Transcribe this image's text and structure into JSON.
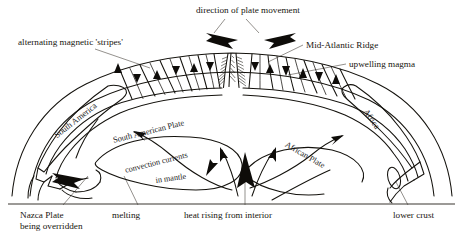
{
  "diagram": {
    "style": {
      "ink": "#14120d",
      "fill": "#ffffff",
      "text": "#17150f"
    },
    "callouts": [
      {
        "id": "direction-of-plate-movement",
        "text": "direction of plate movement",
        "x": 196,
        "y": 6
      },
      {
        "id": "alternating-magnetic-stripes",
        "text": "alternating magnetic 'stripes'",
        "x": 18,
        "y": 38
      },
      {
        "id": "mid-atlantic-ridge",
        "text": "Mid-Atlantic Ridge",
        "x": 306,
        "y": 41
      },
      {
        "id": "upwelling-magma",
        "text": "upwelling magma",
        "x": 349,
        "y": 60
      },
      {
        "id": "melting",
        "text": "melting",
        "x": 112,
        "y": 211
      },
      {
        "id": "heat-rising-from-interior",
        "text": "heat rising from interior",
        "x": 184,
        "y": 211
      },
      {
        "id": "lower-crust",
        "text": "lower crust",
        "x": 393,
        "y": 211
      }
    ],
    "callouts_multiline": [
      {
        "id": "nazca-plate-being-overridden",
        "line1": "Nazca Plate",
        "line2": "being overridden",
        "x": 20,
        "y": 211
      }
    ],
    "map_labels": [
      {
        "id": "south-america",
        "text": "South America",
        "x": 52,
        "y": 132,
        "rotate": -38,
        "size": 8.6
      },
      {
        "id": "south-american-plate",
        "text": "South American Plate",
        "x": 112,
        "y": 136,
        "rotate": -14,
        "size": 8.4
      },
      {
        "id": "convection-currents",
        "text": "convection currents",
        "x": 124,
        "y": 166,
        "rotate": -14,
        "size": 8.2
      },
      {
        "id": "in-mantle",
        "text": "in mantle",
        "x": 155,
        "y": 176,
        "rotate": -8,
        "size": 8.2
      },
      {
        "id": "africa",
        "text": "Africa",
        "x": 370,
        "y": 107,
        "rotate": 56,
        "size": 8.6
      },
      {
        "id": "african-plate",
        "text": "African Plate",
        "x": 288,
        "y": 140,
        "rotate": 30,
        "size": 8.4
      }
    ],
    "arrows": {
      "plate-movement-left": "black swept arrow pointing left",
      "plate-movement-right": "black swept arrow pointing right",
      "ridge-triangles-left": 6,
      "ridge-triangles-right": 5,
      "mantle-convection-arrows": 5,
      "heat-rising-arrow": 1,
      "subduction-arrow": 1
    },
    "baseline": {
      "y": 204,
      "x1": 8,
      "x2": 455
    }
  }
}
